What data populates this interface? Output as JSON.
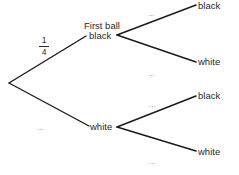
{
  "diagram": {
    "type": "probability-tree",
    "stage_label": "First ball",
    "first_level": [
      {
        "outcome": "black",
        "probability": "1/4",
        "prob_num": "1",
        "prob_den": "4"
      },
      {
        "outcome": "white",
        "probability": "..."
      }
    ],
    "second_level": {
      "black": [
        {
          "outcome": "black",
          "probability": "..."
        },
        {
          "outcome": "white",
          "probability": "..."
        }
      ],
      "white": [
        {
          "outcome": "black",
          "probability": "..."
        },
        {
          "outcome": "white",
          "probability": "..."
        }
      ]
    }
  },
  "colors": {
    "line": "#1a1a1a",
    "text": "#2a2a2a",
    "placeholder": "#8a8a8a"
  }
}
